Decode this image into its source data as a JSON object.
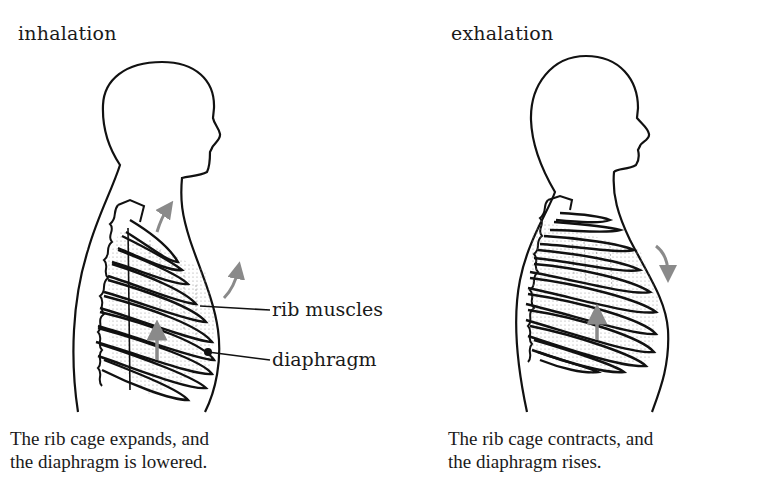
{
  "panels": [
    {
      "title": "inhalation",
      "caption_line1": "The rib cage expands, and",
      "caption_line2": "the diaphragm is lowered.",
      "arrows": [
        "rib-cage-up-arrow",
        "rib-cage-outward-arrow",
        "diaphragm-down-arrow"
      ]
    },
    {
      "title": "exhalation",
      "caption_line1": "The rib cage contracts, and",
      "caption_line2": "the diaphragm rises.",
      "arrows": [
        "rib-cage-down-arrow",
        "diaphragm-up-arrow"
      ]
    }
  ],
  "labels": {
    "rib_muscles": "rib muscles",
    "diaphragm": "diaphragm"
  },
  "colors": {
    "outline": "#111111",
    "arrow": "#8a8a8a",
    "muscle_shading": "#c8c8c8"
  }
}
